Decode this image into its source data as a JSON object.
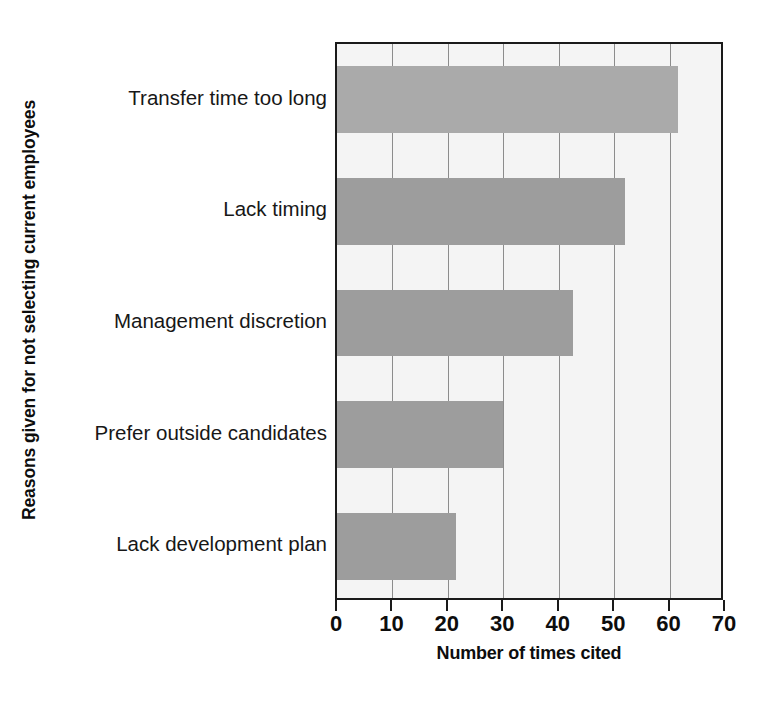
{
  "chart_data": {
    "type": "bar",
    "orientation": "horizontal",
    "title": "",
    "xlabel": "Number of times cited",
    "ylabel": "Reasons given for not selecting current employees",
    "categories": [
      "Transfer time too long",
      "Lack timing",
      "Management discretion",
      "Prefer outside candidates",
      "Lack development plan"
    ],
    "values": [
      61.5,
      52,
      42.5,
      30,
      21.5
    ],
    "xlim": [
      0,
      70
    ],
    "xticks": [
      0,
      10,
      20,
      30,
      40,
      50,
      60,
      70
    ],
    "xtick_labels": [
      "0",
      "10",
      "20",
      "30",
      "40",
      "50",
      "60",
      "70"
    ],
    "grid": "vertical",
    "legend": "none",
    "colors": {
      "bar_fill": "#9d9d9d",
      "bar_fill_first": "#aaaaaa",
      "plot_background": "#f4f4f4",
      "axis_line": "#1a1a1a",
      "gridline": "#8c8c8c",
      "text": "#0d0d0d",
      "page_background": "#ffffff"
    }
  }
}
